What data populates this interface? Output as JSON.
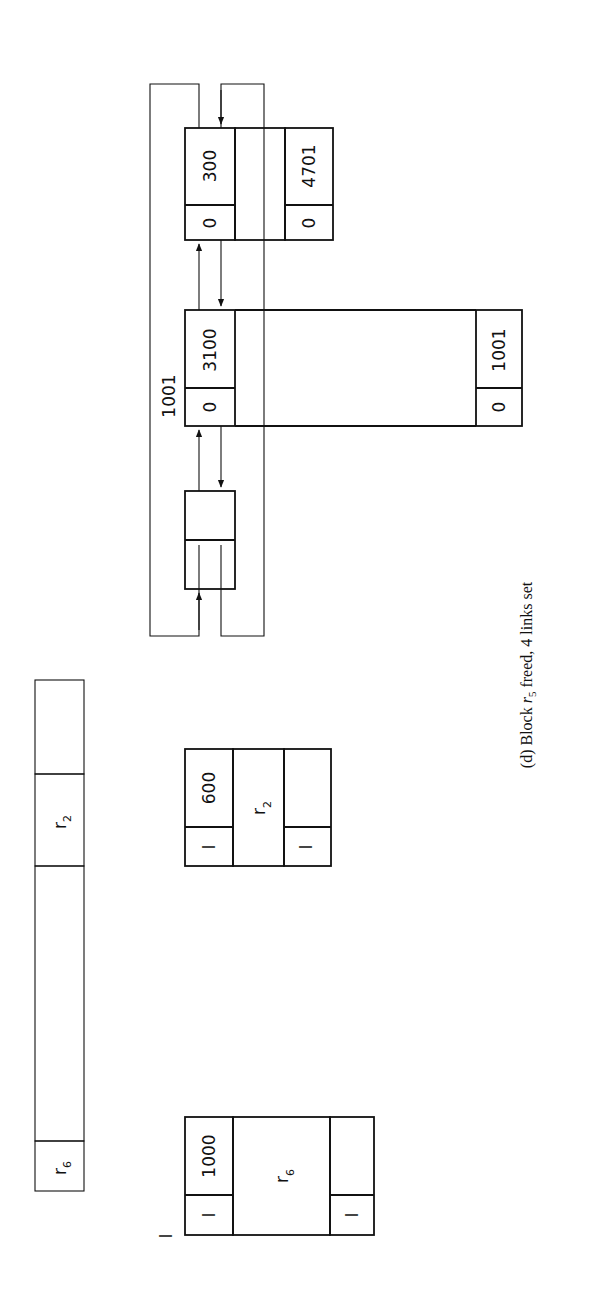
{
  "caption": {
    "prefix": "(d) Block ",
    "var": "r",
    "sub": "5",
    "suffix": " freed, 4 links set"
  },
  "memory_strip": {
    "segments": [
      {
        "label": "r",
        "sub": "6",
        "hatched": false
      },
      {
        "label": "",
        "hatched": true
      },
      {
        "label": "r",
        "sub": "2",
        "hatched": false
      },
      {
        "label": "",
        "hatched": true
      }
    ]
  },
  "stray_mark": "I",
  "block_r6": {
    "head_tag": "I",
    "head_size": "1000",
    "body_label": "r",
    "body_sub": "6",
    "tail_tag": "I",
    "tail_size": ""
  },
  "block_r2": {
    "head_tag": "I",
    "head_size": "600",
    "body_label": "r",
    "body_sub": "2",
    "tail_tag": "I",
    "tail_size": ""
  },
  "free_list": {
    "pointer_label": "1001",
    "head_node": {
      "top": "",
      "bottom": ""
    },
    "block_3100": {
      "head_tag": "0",
      "head_size": "3100",
      "tail_tag": "0",
      "tail_size": "1001"
    },
    "block_300": {
      "head_tag": "0",
      "head_size": "300",
      "tail_tag": "0",
      "tail_size": "4701"
    }
  },
  "colors": {
    "ink": "#111111",
    "paper": "#ffffff",
    "hatch": "#333333"
  }
}
